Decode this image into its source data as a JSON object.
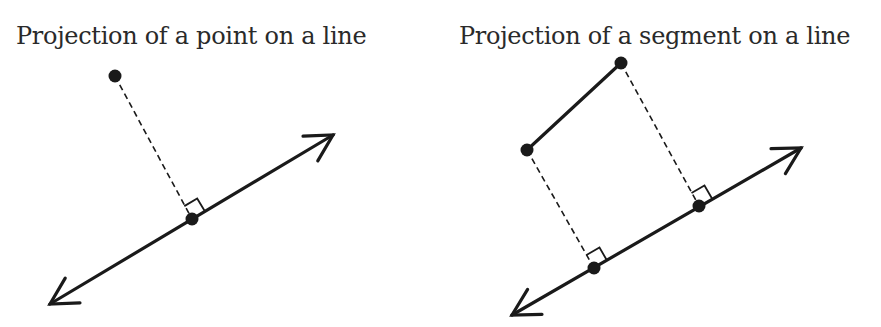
{
  "colors": {
    "background": "#ffffff",
    "stroke": "#1a1a1a",
    "text": "#2a2a2a"
  },
  "panels": [
    {
      "title": "Projection of a point on a line",
      "line": {
        "tail": [
          50,
          304
        ],
        "head": [
          333,
          135
        ]
      },
      "points": [
        {
          "name": "point",
          "xy": [
            115,
            76
          ]
        },
        {
          "name": "projection-foot",
          "xy": [
            192,
            219
          ]
        }
      ],
      "dashed_segments": [
        {
          "from": [
            115,
            76
          ],
          "to": [
            192,
            219
          ]
        }
      ],
      "right_angles": [
        {
          "at": [
            192,
            219
          ]
        }
      ]
    },
    {
      "title": "Projection of a segment on a line",
      "line": {
        "tail": [
          512,
          315
        ],
        "head": [
          801,
          148
        ]
      },
      "segment": {
        "from": [
          527,
          150
        ],
        "to": [
          621,
          63
        ]
      },
      "points": [
        {
          "name": "segment-endpoint-a",
          "xy": [
            621,
            63
          ]
        },
        {
          "name": "segment-endpoint-b",
          "xy": [
            527,
            150
          ]
        },
        {
          "name": "projection-foot-a",
          "xy": [
            699,
            206
          ]
        },
        {
          "name": "projection-foot-b",
          "xy": [
            594,
            268
          ]
        }
      ],
      "dashed_segments": [
        {
          "from": [
            621,
            63
          ],
          "to": [
            699,
            206
          ]
        },
        {
          "from": [
            527,
            150
          ],
          "to": [
            594,
            268
          ]
        }
      ],
      "right_angles": [
        {
          "at": [
            699,
            206
          ]
        },
        {
          "at": [
            594,
            268
          ]
        }
      ]
    }
  ]
}
